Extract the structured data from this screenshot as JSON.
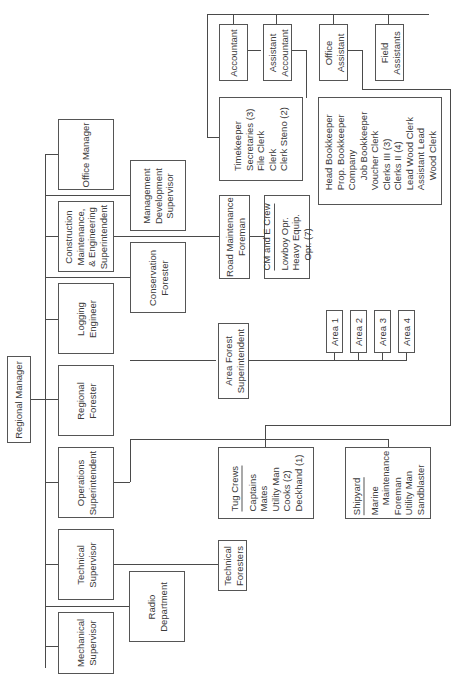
{
  "chart_title": "Regional organization chart",
  "root": {
    "label": [
      "Regional Manager"
    ]
  },
  "level1": [
    {
      "id": "office-manager",
      "label": [
        "Office Manager"
      ]
    },
    {
      "id": "construction",
      "label": [
        "Construction",
        "Maintenance,",
        "& Engineering",
        "Superintendent"
      ]
    },
    {
      "id": "logging-engineer",
      "label": [
        "Logging",
        "Engineer"
      ]
    },
    {
      "id": "regional-forester",
      "label": [
        "Regional",
        "Forester"
      ]
    },
    {
      "id": "operations",
      "label": [
        "Operations",
        "Superintendent"
      ]
    },
    {
      "id": "technical-supervisor",
      "label": [
        "Technical",
        "Supervisor"
      ]
    },
    {
      "id": "mechanical-supervisor",
      "label": [
        "Mechanical",
        "Supervisor"
      ]
    }
  ],
  "staff": [
    {
      "id": "management-development",
      "label": [
        "Management",
        "Development",
        "Supervisor"
      ]
    },
    {
      "id": "conservation-forester",
      "label": [
        "Conservation",
        "Forester"
      ]
    },
    {
      "id": "radio-department",
      "label": [
        "Radio",
        "Department"
      ]
    }
  ],
  "level2": {
    "road_maintenance": {
      "label": [
        "Road Maintenance",
        "Foreman"
      ]
    },
    "cm_crew": {
      "header": "CM and E Crew",
      "items": [
        "Lowboy Opr.",
        "Heavy Equip.",
        "Opr.  (7)"
      ]
    },
    "area_forest": {
      "label": [
        "Area Forest",
        "Superintendent"
      ]
    },
    "areas": [
      "Area 1",
      "Area 2",
      "Area 3",
      "Area 4"
    ],
    "technical_foresters": {
      "label": [
        "Technical",
        "Foresters"
      ]
    },
    "tug_crews": {
      "header": "Tug Crews",
      "items": [
        "Captains",
        "Mates",
        "Utility Man",
        "Cooks  (2)",
        "Deckhand  (1)"
      ]
    },
    "shipyard": {
      "header": "Shipyard",
      "items": [
        "Marine",
        "Maintenance",
        "Foreman",
        "Utility Man",
        "Sandblaster"
      ]
    }
  },
  "office": {
    "accountant": {
      "label": [
        "Accountant"
      ]
    },
    "assistant_accountant": {
      "label": [
        "Assistant",
        "Accountant"
      ]
    },
    "office_assistant": {
      "label": [
        "Office",
        "Assistant"
      ]
    },
    "field_assistants": {
      "label": [
        "Field",
        "Assistants"
      ]
    },
    "clerical": {
      "items": [
        "Timekeeper",
        "Secretaries  (3)",
        "File Clerk",
        "Clerk",
        "Clerk Steno  (2)"
      ]
    },
    "bookkeeping": {
      "items": [
        "Head Bookkeeper",
        "Prop. Bookkeeper",
        "Company",
        "Job Bookkeeper",
        "Voucher Clerk",
        "Clerks III  (3)",
        "Clerks II  (4)",
        "Lead Wood Clerk",
        "Assistant Lead",
        "Wood Clerk"
      ]
    }
  }
}
